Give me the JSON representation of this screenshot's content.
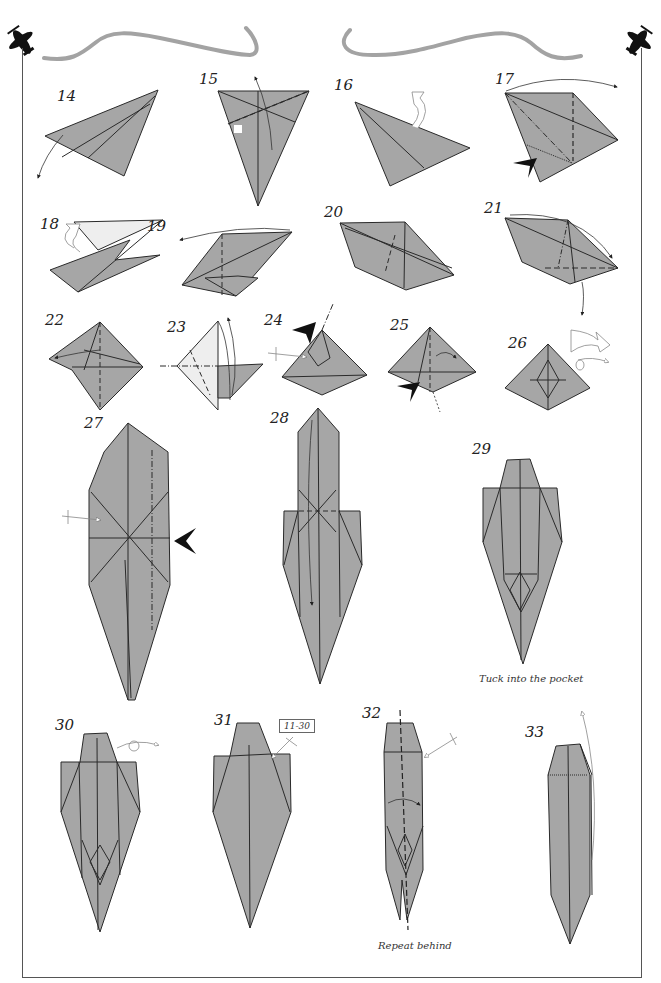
{
  "page": {
    "type": "origami diagram page",
    "paper_color": "#a6a6a6",
    "line_color": "#222222",
    "header_curve_color": "#a3a3a3",
    "icons": [
      "airplane-icon-left",
      "airplane-icon-right"
    ]
  },
  "steps": [
    {
      "number": "14"
    },
    {
      "number": "15"
    },
    {
      "number": "16"
    },
    {
      "number": "17"
    },
    {
      "number": "18"
    },
    {
      "number": "19"
    },
    {
      "number": "20"
    },
    {
      "number": "21"
    },
    {
      "number": "22"
    },
    {
      "number": "23"
    },
    {
      "number": "24"
    },
    {
      "number": "25"
    },
    {
      "number": "26"
    },
    {
      "number": "27"
    },
    {
      "number": "28"
    },
    {
      "number": "29",
      "caption": "Tuck into the pocket"
    },
    {
      "number": "30"
    },
    {
      "number": "31",
      "reference": "11-30"
    },
    {
      "number": "32",
      "caption": "Repeat behind"
    },
    {
      "number": "33"
    }
  ]
}
